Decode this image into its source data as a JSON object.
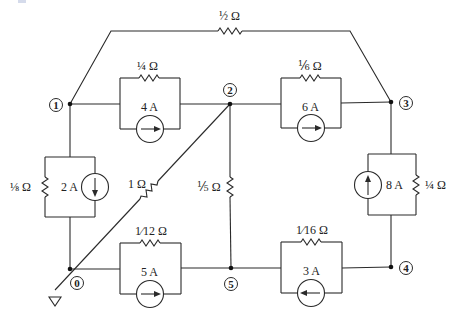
{
  "diagram": {
    "type": "electrical-circuit",
    "nodes": [
      {
        "id": "0",
        "label": "0",
        "note": "reference/ground"
      },
      {
        "id": "1",
        "label": "1"
      },
      {
        "id": "2",
        "label": "2"
      },
      {
        "id": "3",
        "label": "3"
      },
      {
        "id": "4",
        "label": "4"
      },
      {
        "id": "5",
        "label": "5"
      }
    ],
    "labels": {
      "r13": "½ Ω",
      "r12": "¼ Ω",
      "i12": "4 A",
      "r23": "⅙ Ω",
      "i23": "6 A",
      "r10": "⅛ Ω",
      "i10": "2 A",
      "r20": "1 Ω",
      "r25": "⅕ Ω",
      "r34": "¼ Ω",
      "i43": "8 A",
      "r05": "1⁄12 Ω",
      "i05": "5 A",
      "r54": "1⁄16 Ω",
      "i45": "3 A"
    },
    "elements": [
      {
        "type": "resistor",
        "value": "1/2 Ω",
        "between": [
          "1",
          "3"
        ]
      },
      {
        "type": "resistor",
        "value": "1/4 Ω",
        "between": [
          "1",
          "2"
        ]
      },
      {
        "type": "current-source",
        "value": "4 A",
        "from": "1",
        "to": "2"
      },
      {
        "type": "resistor",
        "value": "1/6 Ω",
        "between": [
          "2",
          "3"
        ]
      },
      {
        "type": "current-source",
        "value": "6 A",
        "from": "2",
        "to": "3"
      },
      {
        "type": "resistor",
        "value": "1/8 Ω",
        "between": [
          "1",
          "0"
        ]
      },
      {
        "type": "current-source",
        "value": "2 A",
        "from": "1",
        "to": "0"
      },
      {
        "type": "resistor",
        "value": "1 Ω",
        "between": [
          "2",
          "0"
        ]
      },
      {
        "type": "resistor",
        "value": "1/5 Ω",
        "between": [
          "2",
          "5"
        ]
      },
      {
        "type": "resistor",
        "value": "1/4 Ω",
        "between": [
          "3",
          "4"
        ]
      },
      {
        "type": "current-source",
        "value": "8 A",
        "from": "4",
        "to": "3"
      },
      {
        "type": "resistor",
        "value": "1/12 Ω",
        "between": [
          "0",
          "5"
        ]
      },
      {
        "type": "current-source",
        "value": "5 A",
        "from": "0",
        "to": "5"
      },
      {
        "type": "resistor",
        "value": "1/16 Ω",
        "between": [
          "5",
          "4"
        ]
      },
      {
        "type": "current-source",
        "value": "3 A",
        "from": "4",
        "to": "5"
      }
    ]
  }
}
